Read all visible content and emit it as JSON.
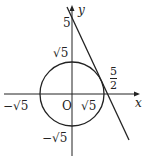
{
  "labels": {
    "y_axis": "y",
    "x_axis": "x",
    "y_intercept": "5",
    "circle_top": "√5",
    "circle_right": "√5",
    "circle_left": "−√5",
    "circle_bottom": "−√5",
    "origin": "O",
    "x_intercept_num": "5",
    "x_intercept_den": "2"
  },
  "geometry": {
    "circle": "x² + y² = 5",
    "tangent_line": "y = −2x + 5",
    "colors": {
      "stroke": "#222222",
      "background": "#ffffff"
    }
  }
}
